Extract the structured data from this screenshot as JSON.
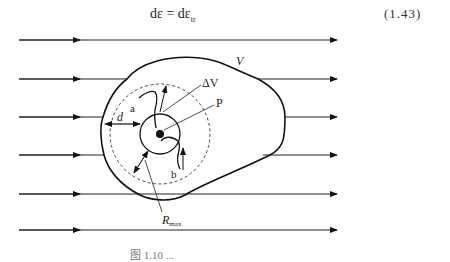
{
  "equation": {
    "lhs": "dε",
    "eq": " = ",
    "rhs_main": "dε",
    "rhs_sub": "tr",
    "number": "(1.43)"
  },
  "diagram": {
    "labels": {
      "volume": "V",
      "delta_volume": "ΔV",
      "point": "P",
      "path_a": "a",
      "path_b": "b",
      "distance": "d",
      "radius_main": "R",
      "radius_sub": "max"
    },
    "flow_lines_y": [
      40,
      79,
      117,
      156,
      194,
      240
    ]
  },
  "caption": "图 1.10  ..."
}
